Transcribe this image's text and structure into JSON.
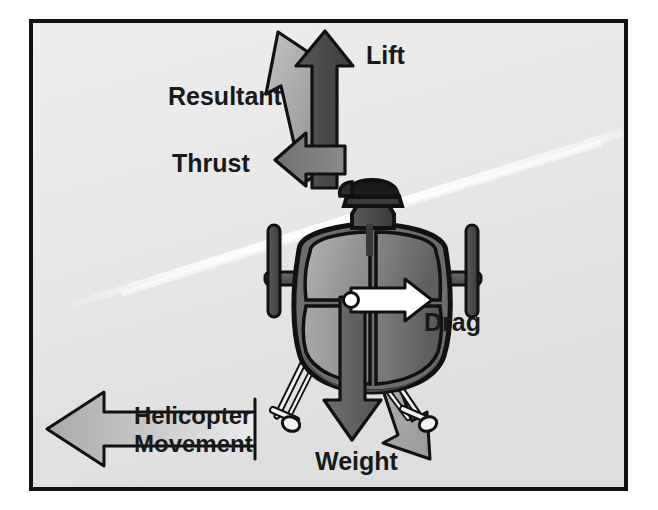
{
  "figure": {
    "width": 658,
    "height": 510,
    "border_color": "#111111",
    "background_color": "#e9e9e9",
    "page_color": "#ffffff"
  },
  "labels": {
    "lift": "Lift",
    "resultant": "Resultant",
    "thrust": "Thrust",
    "drag": "Drag",
    "weight": "Weight",
    "movement_line1": "Helicopter",
    "movement_line2": "Movement"
  },
  "vectors": [
    {
      "name": "lift",
      "label": "Lift",
      "direction": "up",
      "color": "#4d4d4d",
      "outline": "#111111",
      "description": "Vertical arrow pointing straight up from the rotor mast"
    },
    {
      "name": "resultant",
      "label": "Resultant",
      "direction": "up-left",
      "color": "#a6a6a6",
      "outline": "#111111",
      "description": "Diagonal arrow pointing up and to the left, the vector sum of lift and thrust"
    },
    {
      "name": "thrust",
      "label": "Thrust",
      "direction": "left",
      "color": "#777777",
      "outline": "#111111",
      "description": "Horizontal arrow pointing left in the direction of travel"
    },
    {
      "name": "drag",
      "label": "Drag",
      "direction": "right",
      "color": "#ffffff",
      "outline": "#111111",
      "description": "Small white arrow pointing right, opposing the direction of travel"
    },
    {
      "name": "weight",
      "label": "Weight",
      "direction": "down",
      "color": "#6a6a6a",
      "outline": "#111111",
      "description": "Vertical arrow pointing straight down through the centre of gravity"
    },
    {
      "name": "weight-resultant",
      "label": "",
      "direction": "down-right",
      "color": "#a6a6a6",
      "outline": "#111111",
      "description": "Light diagonal arrow pointing down and to the right behind the weight arrow"
    },
    {
      "name": "helicopter-movement",
      "label": "Helicopter Movement",
      "direction": "left",
      "color": "#bcbcbc",
      "outline": "#111111",
      "description": "Large outlined banner arrow pointing left labelled Helicopter Movement"
    }
  ],
  "aircraft": {
    "name": "helicopter",
    "view": "front elevation",
    "parts": [
      "rotor-mast",
      "rotor-head",
      "fuselage",
      "canopy-glazing",
      "horizontal-stabilizer",
      "stabilizer-fins",
      "landing-skids",
      "centre-of-gravity-dot"
    ],
    "body_color_light": "#9a9a9a",
    "body_color_dark": "#5f5f5f",
    "outline": "#111111"
  },
  "rotor_blur": {
    "name": "rotor-disc-blur",
    "description": "Pale diagonal streak across the background representing the spinning main rotor blade",
    "color": "#fbfbfb"
  }
}
